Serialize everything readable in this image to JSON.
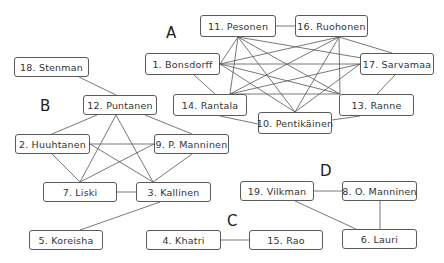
{
  "diagram": {
    "type": "network-graph",
    "clusters": [
      {
        "id": "A",
        "label": "A",
        "x": 166,
        "y": 24
      },
      {
        "id": "B",
        "label": "B",
        "x": 40,
        "y": 97
      },
      {
        "id": "C",
        "label": "C",
        "x": 227,
        "y": 212
      },
      {
        "id": "D",
        "label": "D",
        "x": 320,
        "y": 162
      }
    ],
    "nodes": [
      {
        "id": "11",
        "label": "11. Pesonen",
        "cluster": "A",
        "x": 200,
        "y": 15,
        "w": 76,
        "h": 22
      },
      {
        "id": "16",
        "label": "16. Ruohonen",
        "cluster": "A",
        "x": 295,
        "y": 15,
        "w": 73,
        "h": 22
      },
      {
        "id": "1",
        "label": "1. Bonsdorff",
        "cluster": "A",
        "x": 145,
        "y": 53,
        "w": 75,
        "h": 22
      },
      {
        "id": "17",
        "label": "17. Sarvamaa",
        "cluster": "A",
        "x": 360,
        "y": 53,
        "w": 74,
        "h": 22
      },
      {
        "id": "14",
        "label": "14. Rantala",
        "cluster": "A",
        "x": 173,
        "y": 94,
        "w": 74,
        "h": 22
      },
      {
        "id": "13",
        "label": "13. Ranne",
        "cluster": "A",
        "x": 339,
        "y": 94,
        "w": 75,
        "h": 22
      },
      {
        "id": "10",
        "label": "10. Pentikäinen",
        "cluster": "A",
        "x": 258,
        "y": 112,
        "w": 74,
        "h": 22
      },
      {
        "id": "18",
        "label": "18. Stenman",
        "cluster": "B",
        "x": 14,
        "y": 57,
        "w": 75,
        "h": 20
      },
      {
        "id": "12",
        "label": "12. Puntanen",
        "cluster": "B",
        "x": 83,
        "y": 95,
        "w": 74,
        "h": 20
      },
      {
        "id": "2",
        "label": "2. Huuhtanen",
        "cluster": "B",
        "x": 15,
        "y": 134,
        "w": 75,
        "h": 20
      },
      {
        "id": "9",
        "label": "9. P. Manninen",
        "cluster": "B",
        "x": 154,
        "y": 134,
        "w": 75,
        "h": 20
      },
      {
        "id": "7",
        "label": "7. Liski",
        "cluster": "B",
        "x": 43,
        "y": 182,
        "w": 74,
        "h": 20
      },
      {
        "id": "3",
        "label": "3. Kallinen",
        "cluster": "B",
        "x": 136,
        "y": 182,
        "w": 75,
        "h": 20
      },
      {
        "id": "5",
        "label": "5. Koreisha",
        "cluster": "B",
        "x": 29,
        "y": 230,
        "w": 74,
        "h": 20
      },
      {
        "id": "4",
        "label": "4. Khatri",
        "cluster": "C",
        "x": 146,
        "y": 230,
        "w": 75,
        "h": 20
      },
      {
        "id": "15",
        "label": "15. Rao",
        "cluster": "C",
        "x": 249,
        "y": 230,
        "w": 74,
        "h": 20
      },
      {
        "id": "19",
        "label": "19. Vilkman",
        "cluster": "D",
        "x": 240,
        "y": 181,
        "w": 74,
        "h": 20
      },
      {
        "id": "8",
        "label": "8. O. Manninen",
        "cluster": "D",
        "x": 342,
        "y": 181,
        "w": 75,
        "h": 20
      },
      {
        "id": "6",
        "label": "6. Lauri",
        "cluster": "D",
        "x": 342,
        "y": 229,
        "w": 75,
        "h": 20
      }
    ],
    "edges": [
      {
        "x1": 276,
        "y1": 26,
        "x2": 295,
        "y2": 26
      },
      {
        "x1": 238,
        "y1": 37,
        "x2": 220,
        "y2": 64
      },
      {
        "x1": 238,
        "y1": 37,
        "x2": 397,
        "y2": 64
      },
      {
        "x1": 238,
        "y1": 37,
        "x2": 230,
        "y2": 94
      },
      {
        "x1": 238,
        "y1": 37,
        "x2": 340,
        "y2": 94
      },
      {
        "x1": 238,
        "y1": 37,
        "x2": 295,
        "y2": 112
      },
      {
        "x1": 339,
        "y1": 37,
        "x2": 220,
        "y2": 64
      },
      {
        "x1": 339,
        "y1": 37,
        "x2": 392,
        "y2": 53
      },
      {
        "x1": 339,
        "y1": 37,
        "x2": 230,
        "y2": 94
      },
      {
        "x1": 339,
        "y1": 37,
        "x2": 340,
        "y2": 94
      },
      {
        "x1": 339,
        "y1": 37,
        "x2": 295,
        "y2": 112
      },
      {
        "x1": 220,
        "y1": 64,
        "x2": 360,
        "y2": 64
      },
      {
        "x1": 220,
        "y1": 64,
        "x2": 340,
        "y2": 94
      },
      {
        "x1": 220,
        "y1": 64,
        "x2": 295,
        "y2": 112
      },
      {
        "x1": 194,
        "y1": 75,
        "x2": 215,
        "y2": 94
      },
      {
        "x1": 360,
        "y1": 64,
        "x2": 230,
        "y2": 94
      },
      {
        "x1": 360,
        "y1": 64,
        "x2": 295,
        "y2": 112
      },
      {
        "x1": 395,
        "y1": 75,
        "x2": 377,
        "y2": 94
      },
      {
        "x1": 230,
        "y1": 94,
        "x2": 340,
        "y2": 94
      },
      {
        "x1": 220,
        "y1": 116,
        "x2": 258,
        "y2": 124
      },
      {
        "x1": 332,
        "y1": 120,
        "x2": 360,
        "y2": 116
      },
      {
        "x1": 79,
        "y1": 77,
        "x2": 116,
        "y2": 95
      },
      {
        "x1": 97,
        "y1": 115,
        "x2": 52,
        "y2": 134
      },
      {
        "x1": 145,
        "y1": 115,
        "x2": 192,
        "y2": 134
      },
      {
        "x1": 116,
        "y1": 115,
        "x2": 80,
        "y2": 182
      },
      {
        "x1": 116,
        "y1": 115,
        "x2": 153,
        "y2": 182
      },
      {
        "x1": 90,
        "y1": 144,
        "x2": 154,
        "y2": 144
      },
      {
        "x1": 90,
        "y1": 144,
        "x2": 153,
        "y2": 182
      },
      {
        "x1": 52,
        "y1": 154,
        "x2": 80,
        "y2": 182
      },
      {
        "x1": 154,
        "y1": 144,
        "x2": 80,
        "y2": 182
      },
      {
        "x1": 192,
        "y1": 154,
        "x2": 153,
        "y2": 182
      },
      {
        "x1": 117,
        "y1": 192,
        "x2": 136,
        "y2": 192
      },
      {
        "x1": 160,
        "y1": 202,
        "x2": 80,
        "y2": 230
      },
      {
        "x1": 221,
        "y1": 240,
        "x2": 249,
        "y2": 240
      },
      {
        "x1": 314,
        "y1": 191,
        "x2": 342,
        "y2": 191
      },
      {
        "x1": 295,
        "y1": 201,
        "x2": 356,
        "y2": 229
      },
      {
        "x1": 380,
        "y1": 201,
        "x2": 380,
        "y2": 229
      }
    ]
  }
}
